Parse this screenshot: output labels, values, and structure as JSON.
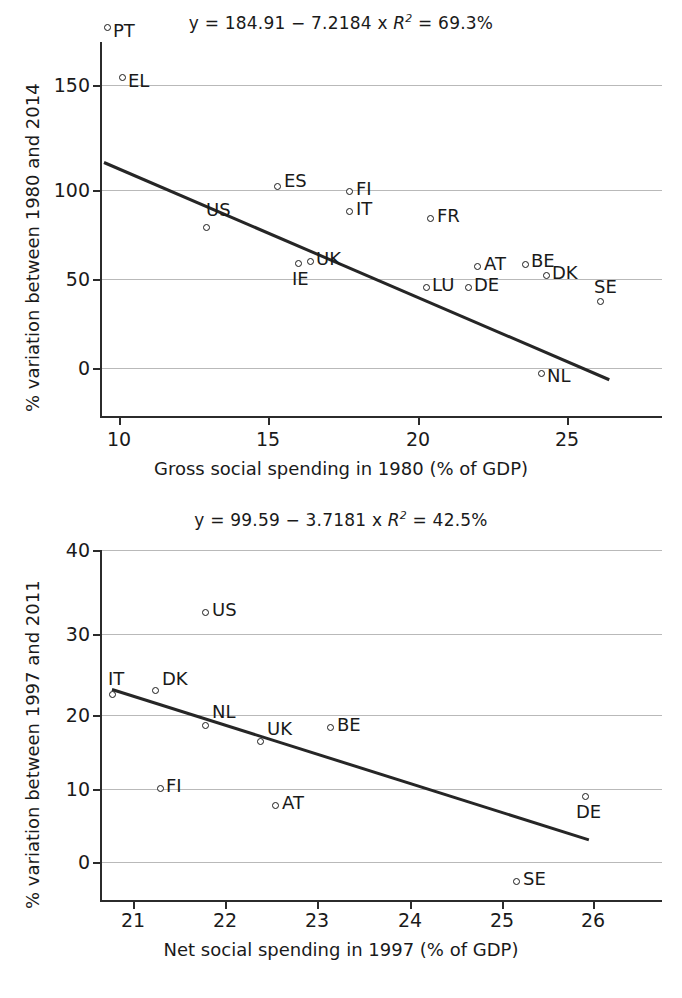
{
  "figure": {
    "width": 682,
    "height": 998,
    "background": "#ffffff",
    "ink": "#1a1a1a",
    "grid_color": "#b9b9b9"
  },
  "panels": [
    {
      "id": "top",
      "title_parts": {
        "lead": "y = 184.91 − 7.2184 x ",
        "r": "R",
        "sup": "2",
        "tail": " = 69.3%"
      },
      "title_full": "y = 184.91 − 7.2184 x R2 = 69.3%",
      "xlabel": "Gross social spending in 1980 (% of GDP)",
      "ylabel": "% variation between 1980 and 2014",
      "xticks": [
        "10",
        "15",
        "20",
        "25"
      ],
      "yticks": [
        "150",
        "100",
        "50",
        "0"
      ]
    },
    {
      "id": "bottom",
      "title_parts": {
        "lead": "y = 99.59 − 3.7181 x ",
        "r": "R",
        "sup": "2",
        "tail": " = 42.5%"
      },
      "title_full": "y = 99.59 − 3.7181 x R2 = 42.5%",
      "xlabel": "Net social spending in 1997 (% of GDP)",
      "ylabel": "% variation between 1997 and 2011",
      "xticks": [
        "21",
        "22",
        "23",
        "24",
        "25",
        "26"
      ],
      "yticks": [
        "40",
        "30",
        "20",
        "10",
        "0"
      ]
    }
  ],
  "chart_data": [
    {
      "type": "scatter",
      "title": "y = 184.91 − 7.2184 x   R² = 69.3%",
      "xlabel": "Gross social spending in 1980 (% of GDP)",
      "ylabel": "% variation between 1980 and 2014",
      "xlim": [
        9.2,
        26.4
      ],
      "ylim": [
        -13,
        168
      ],
      "xticks": [
        10,
        15,
        20,
        25
      ],
      "yticks": [
        0,
        50,
        100,
        150
      ],
      "grid": "horizontal",
      "legend": "none",
      "regression": {
        "equation": "y = 184.91 - 7.2184 x",
        "intercept": 184.91,
        "slope": -7.2184,
        "r_squared_percent": 69.3,
        "x_start": 9.5,
        "x_end": 26.4
      },
      "points": [
        {
          "label": "PT",
          "x": 9.7,
          "y": 162,
          "label_pos": "right"
        },
        {
          "label": "EL",
          "x": 10.2,
          "y": 134,
          "label_pos": "right"
        },
        {
          "label": "ES",
          "x": 15.4,
          "y": 73,
          "label_pos": "right"
        },
        {
          "label": "FI",
          "x": 17.8,
          "y": 70,
          "label_pos": "right"
        },
        {
          "label": "IT",
          "x": 17.8,
          "y": 59,
          "label_pos": "right"
        },
        {
          "label": "FR",
          "x": 20.5,
          "y": 55,
          "label_pos": "right"
        },
        {
          "label": "US",
          "x": 12.8,
          "y": 50,
          "label_pos": "above-right"
        },
        {
          "label": "UK",
          "x": 16.3,
          "y": 31,
          "label_pos": "right"
        },
        {
          "label": "IE",
          "x": 15.9,
          "y": 30,
          "label_pos": "below"
        },
        {
          "label": "AT",
          "x": 21.9,
          "y": 28,
          "label_pos": "right"
        },
        {
          "label": "BE",
          "x": 23.5,
          "y": 29,
          "label_pos": "right"
        },
        {
          "label": "DK",
          "x": 24.2,
          "y": 23,
          "label_pos": "right"
        },
        {
          "label": "LU",
          "x": 20.2,
          "y": 16,
          "label_pos": "right"
        },
        {
          "label": "DE",
          "x": 21.6,
          "y": 16,
          "label_pos": "right"
        },
        {
          "label": "SE",
          "x": 26.0,
          "y": 8,
          "label_pos": "above"
        },
        {
          "label": "NL",
          "x": 24.7,
          "y": -1,
          "label_pos": "right-below"
        }
      ]
    },
    {
      "type": "scatter",
      "title": "y = 99.59 − 3.7181 x   R² = 42.5%",
      "xlabel": "Net social spending in 1997 (% of GDP)",
      "ylabel": "% variation between 1997 and 2011",
      "xlim": [
        20.75,
        26.75
      ],
      "ylim": [
        -5,
        42
      ],
      "xticks": [
        21,
        22,
        23,
        24,
        25,
        26
      ],
      "yticks": [
        0,
        10,
        20,
        30,
        40
      ],
      "grid": "horizontal",
      "legend": "none",
      "regression": {
        "equation": "y = 99.59 - 3.7181 x",
        "intercept": 99.59,
        "slope": -3.7181,
        "r_squared_percent": 42.5,
        "x_start": 20.77,
        "x_end": 25.95
      },
      "points": [
        {
          "label": "US",
          "x": 21.78,
          "y": 32.5,
          "label_pos": "right"
        },
        {
          "label": "IT",
          "x": 20.77,
          "y": 22.3,
          "label_pos": "above-right"
        },
        {
          "label": "DK",
          "x": 21.23,
          "y": 22.8,
          "label_pos": "right"
        },
        {
          "label": "NL",
          "x": 21.77,
          "y": 18.5,
          "label_pos": "above-right"
        },
        {
          "label": "UK",
          "x": 22.37,
          "y": 16.3,
          "label_pos": "above-right"
        },
        {
          "label": "BE",
          "x": 23.13,
          "y": 18.2,
          "label_pos": "right"
        },
        {
          "label": "FI",
          "x": 21.28,
          "y": 10.0,
          "label_pos": "right"
        },
        {
          "label": "AT",
          "x": 22.53,
          "y": 7.8,
          "label_pos": "right"
        },
        {
          "label": "DE",
          "x": 25.9,
          "y": 9.3,
          "label_pos": "below"
        },
        {
          "label": "SE",
          "x": 25.15,
          "y": -2.2,
          "label_pos": "right"
        }
      ]
    }
  ]
}
